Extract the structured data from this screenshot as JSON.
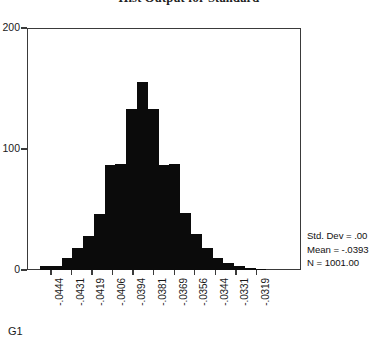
{
  "chart_data": {
    "type": "bar",
    "title": "Hist Output for Standard",
    "xlabel": "G1",
    "ylabel": "",
    "ylim": [
      0,
      200
    ],
    "yticks": [
      "0",
      "100",
      "200"
    ],
    "ytick_values": [
      0,
      100,
      200
    ],
    "grid": false,
    "legend": "none",
    "bar_color": "#0b0b0b",
    "xtick_labels": [
      "-.0444",
      "-.0431",
      "-.0419",
      "-.0406",
      "-.0394",
      "-.0381",
      "-.0369",
      "-.0356",
      "-.0344",
      "-.0331",
      "-.0319"
    ],
    "xtick_values": [
      -0.0444,
      -0.0431,
      -0.0419,
      -0.0406,
      -0.0394,
      -0.0381,
      -0.0369,
      -0.0356,
      -0.0344,
      -0.0331,
      -0.0319
    ],
    "categories": [
      "-.0447",
      "-.0441",
      "-.0434",
      "-.0428",
      "-.0422",
      "-.0416",
      "-.0409",
      "-.0403",
      "-.0397",
      "-.0391",
      "-.0384",
      "-.0378",
      "-.0372",
      "-.0366",
      "-.0359",
      "-.0353",
      "-.0347",
      "-.0341",
      "-.0334",
      "-.0328",
      "-.0322"
    ],
    "values": [
      3,
      3,
      10,
      18,
      28,
      46,
      87,
      88,
      133,
      155,
      133,
      87,
      88,
      47,
      30,
      18,
      10,
      6,
      3,
      2,
      1
    ]
  },
  "statistics": {
    "std_dev": "Std. Dev = .00",
    "mean": "Mean = -.0393",
    "n": "N = 1001.00"
  },
  "axis": {
    "series_label": "G1"
  }
}
